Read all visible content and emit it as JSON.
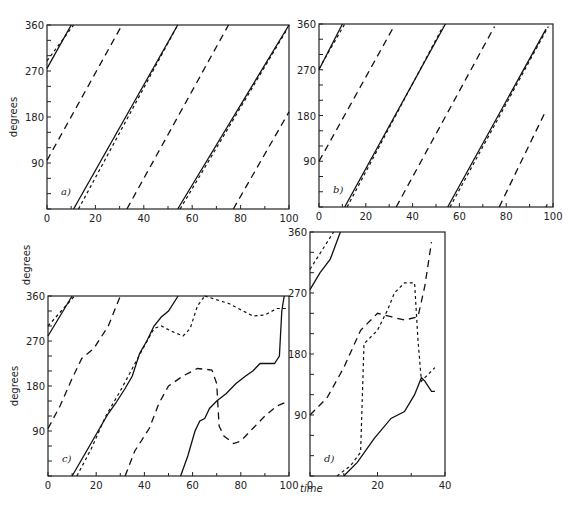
{
  "figure": {
    "ylabel": "degrees",
    "xlabel": "time"
  },
  "chart_data": [
    {
      "panel": "a)",
      "type": "line",
      "title": "",
      "xlabel": "",
      "ylabel": "degrees",
      "xlim": [
        0,
        100
      ],
      "ylim": [
        0,
        360
      ],
      "xticks": [
        0,
        20,
        40,
        60,
        80,
        100
      ],
      "yticks": [
        90,
        180,
        270,
        360
      ],
      "grid": false,
      "frame": {
        "x0": 47,
        "y0": 25,
        "x1": 289,
        "y1": 209
      },
      "series": [
        {
          "name": "solid",
          "style": "solid",
          "segments": [
            [
              [
                0,
                275
              ],
              [
                10,
                360
              ]
            ],
            [
              [
                11,
                0
              ],
              [
                54,
                360
              ]
            ],
            [
              [
                54,
                0
              ],
              [
                100,
                360
              ]
            ]
          ]
        },
        {
          "name": "dotted",
          "style": "dot",
          "segments": [
            [
              [
                0,
                290
              ],
              [
                11,
                360
              ]
            ],
            [
              [
                13,
                0
              ],
              [
                54,
                360
              ]
            ],
            [
              [
                55,
                0
              ],
              [
                99,
                350
              ]
            ]
          ]
        },
        {
          "name": "dashed",
          "style": "dash",
          "segments": [
            [
              [
                0,
                95
              ],
              [
                31,
                360
              ]
            ],
            [
              [
                33,
                0
              ],
              [
                75,
                360
              ]
            ],
            [
              [
                77,
                0
              ],
              [
                100,
                190
              ]
            ]
          ]
        }
      ]
    },
    {
      "panel": "b)",
      "type": "line",
      "xlabel": "",
      "ylabel": "",
      "xlim": [
        0,
        100
      ],
      "ylim": [
        0,
        360
      ],
      "xticks": [
        0,
        20,
        40,
        60,
        80,
        100
      ],
      "yticks": [
        90,
        180,
        270,
        360
      ],
      "grid": false,
      "frame": {
        "x0": 319,
        "y0": 24,
        "x1": 553,
        "y1": 207
      },
      "series": [
        {
          "name": "solid",
          "style": "solid",
          "segments": [
            [
              [
                0,
                270
              ],
              [
                10,
                360
              ]
            ],
            [
              [
                11,
                0
              ],
              [
                54,
                360
              ]
            ],
            [
              [
                55,
                0
              ],
              [
                97,
                350
              ]
            ]
          ]
        },
        {
          "name": "dotted",
          "style": "dot",
          "segments": [
            [
              [
                0,
                272
              ],
              [
                11,
                360
              ]
            ],
            [
              [
                12,
                0
              ],
              [
                53,
                355
              ]
            ],
            [
              [
                56,
                0
              ],
              [
                98,
                355
              ]
            ],
            [
              [
                97,
                0
              ],
              [
                98,
                10
              ]
            ]
          ]
        },
        {
          "name": "dashed",
          "style": "dash",
          "segments": [
            [
              [
                0,
                90
              ],
              [
                32,
                355
              ]
            ],
            [
              [
                33,
                0
              ],
              [
                75,
                355
              ]
            ],
            [
              [
                77,
                0
              ],
              [
                97,
                190
              ]
            ]
          ]
        }
      ]
    },
    {
      "panel": "c)",
      "type": "line",
      "xlabel": "time",
      "ylabel": "degrees",
      "xlim": [
        0,
        100
      ],
      "ylim": [
        0,
        360
      ],
      "xticks": [
        0,
        20,
        40,
        60,
        80,
        100
      ],
      "yticks": [
        90,
        180,
        270,
        360
      ],
      "grid": false,
      "frame": {
        "x0": 48,
        "y0": 296,
        "x1": 289,
        "y1": 476
      },
      "series": [
        {
          "name": "solid",
          "style": "solid",
          "segments": [
            [
              [
                0,
                280
              ],
              [
                10,
                360
              ]
            ],
            [
              [
                10,
                0
              ],
              [
                16,
                50
              ],
              [
                22,
                100
              ],
              [
                25,
                125
              ],
              [
                28,
                145
              ],
              [
                32,
                175
              ],
              [
                35,
                200
              ],
              [
                38,
                245
              ],
              [
                41,
                270
              ],
              [
                44,
                300
              ],
              [
                47,
                318
              ],
              [
                50,
                330
              ],
              [
                54,
                360
              ]
            ],
            [
              [
                55,
                0
              ],
              [
                58,
                40
              ],
              [
                61,
                90
              ],
              [
                63,
                110
              ],
              [
                65,
                115
              ],
              [
                67,
                135
              ],
              [
                70,
                150
              ],
              [
                74,
                165
              ],
              [
                78,
                185
              ],
              [
                82,
                200
              ],
              [
                85,
                210
              ],
              [
                88,
                225
              ],
              [
                91,
                225
              ],
              [
                94,
                225
              ],
              [
                96,
                240
              ],
              [
                97,
                330
              ],
              [
                98,
                360
              ]
            ]
          ]
        },
        {
          "name": "dotted",
          "style": "dot",
          "segments": [
            [
              [
                0,
                300
              ],
              [
                11,
                360
              ]
            ],
            [
              [
                12,
                0
              ],
              [
                18,
                55
              ],
              [
                24,
                120
              ],
              [
                30,
                170
              ],
              [
                35,
                215
              ],
              [
                40,
                260
              ],
              [
                44,
                295
              ],
              [
                47,
                300
              ],
              [
                51,
                290
              ],
              [
                56,
                280
              ],
              [
                59,
                295
              ],
              [
                62,
                340
              ],
              [
                65,
                360
              ]
            ],
            [
              [
                65,
                360
              ],
              [
                75,
                345
              ],
              [
                85,
                320
              ],
              [
                90,
                322
              ],
              [
                95,
                335
              ],
              [
                100,
                335
              ]
            ]
          ]
        },
        {
          "name": "dashed",
          "style": "dash",
          "segments": [
            [
              [
                0,
                95
              ],
              [
                5,
                140
              ],
              [
                10,
                195
              ],
              [
                14,
                235
              ],
              [
                19,
                255
              ],
              [
                25,
                300
              ],
              [
                30,
                360
              ]
            ],
            [
              [
                32,
                0
              ],
              [
                36,
                50
              ],
              [
                42,
                95
              ],
              [
                46,
                145
              ],
              [
                50,
                180
              ],
              [
                56,
                200
              ],
              [
                62,
                215
              ],
              [
                68,
                212
              ],
              [
                70,
                185
              ],
              [
                71,
                100
              ],
              [
                73,
                80
              ],
              [
                77,
                65
              ],
              [
                80,
                70
              ],
              [
                85,
                95
              ],
              [
                90,
                120
              ],
              [
                95,
                140
              ],
              [
                100,
                150
              ]
            ]
          ]
        }
      ]
    },
    {
      "panel": "d)",
      "type": "line",
      "xlabel": "time",
      "ylabel": "",
      "xlim": [
        0,
        40
      ],
      "ylim": [
        0,
        360
      ],
      "xticks": [
        0,
        20,
        40
      ],
      "yticks": [
        90,
        180,
        270,
        360
      ],
      "grid": false,
      "frame": {
        "x0": 310,
        "y0": 232,
        "x1": 445,
        "y1": 476
      },
      "series": [
        {
          "name": "solid",
          "style": "solid",
          "segments": [
            [
              [
                0,
                275
              ],
              [
                3,
                300
              ],
              [
                6,
                320
              ],
              [
                9,
                360
              ]
            ],
            [
              [
                10,
                0
              ],
              [
                14,
                20
              ],
              [
                19,
                55
              ],
              [
                24,
                85
              ],
              [
                28,
                95
              ],
              [
                31,
                120
              ],
              [
                33,
                145
              ],
              [
                34,
                140
              ],
              [
                36,
                125
              ],
              [
                37,
                125
              ]
            ]
          ]
        },
        {
          "name": "dotted",
          "style": "dot",
          "segments": [
            [
              [
                0,
                305
              ],
              [
                7,
                360
              ]
            ],
            [
              [
                8,
                0
              ],
              [
                12,
                15
              ],
              [
                15,
                35
              ],
              [
                16,
                195
              ],
              [
                20,
                215
              ],
              [
                23,
                245
              ],
              [
                25,
                270
              ],
              [
                28,
                285
              ],
              [
                31,
                285
              ],
              [
                32,
                200
              ],
              [
                33,
                140
              ],
              [
                34,
                145
              ],
              [
                37,
                160
              ]
            ]
          ]
        },
        {
          "name": "dashed",
          "style": "dash",
          "segments": [
            [
              [
                0,
                90
              ],
              [
                5,
                115
              ],
              [
                10,
                160
              ],
              [
                15,
                215
              ],
              [
                20,
                240
              ],
              [
                24,
                235
              ],
              [
                28,
                230
              ],
              [
                32,
                235
              ],
              [
                34,
                280
              ],
              [
                36,
                345
              ]
            ]
          ]
        }
      ]
    }
  ],
  "labels": {
    "a": {
      "tag": "a)",
      "ylabel": "degrees",
      "xticks": [
        "0",
        "20",
        "40",
        "60",
        "80",
        "100"
      ],
      "yticks": [
        "90",
        "180",
        "270",
        "360"
      ]
    },
    "b": {
      "tag": "b)",
      "xticks": [
        "0",
        "20",
        "40",
        "60",
        "80",
        "100"
      ],
      "yticks": [
        "90",
        "180",
        "270",
        "360"
      ]
    },
    "c": {
      "tag": "c)",
      "ylabel": "degrees",
      "xlabel": "time",
      "xticks": [
        "0",
        "20",
        "40",
        "60",
        "80",
        "100"
      ],
      "yticks": [
        "90",
        "180",
        "270",
        "360"
      ]
    },
    "d": {
      "tag": "d)",
      "xticks": [
        "0",
        "20",
        "40"
      ],
      "yticks": [
        "90",
        "180",
        "270",
        "360"
      ]
    },
    "stray_ylabel": "degrees"
  }
}
